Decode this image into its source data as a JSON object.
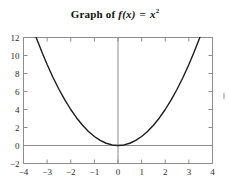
{
  "title": {
    "prefix": "Graph of ",
    "function_name": "f",
    "argument": "(x)",
    "equals": " = ",
    "expression_base": "x",
    "expression_exponent": "2",
    "plain": "Graph of f(x) = x^2"
  },
  "chart_data": {
    "type": "line",
    "xlabel": "",
    "ylabel": "",
    "function": "f(x) = x^2",
    "xlim": [
      -4,
      4
    ],
    "ylim": [
      -2,
      12
    ],
    "grid": false,
    "legend": null,
    "x_ticks": [
      -4,
      -3,
      -2,
      -1,
      0,
      1,
      2,
      3,
      4
    ],
    "x_tick_labels": [
      "-4",
      "-3",
      "-2",
      "-1",
      "0",
      "1",
      "2",
      "3",
      "4"
    ],
    "y_ticks": [
      -2,
      0,
      2,
      4,
      6,
      8,
      10,
      12
    ],
    "y_tick_labels": [
      "-2",
      "0",
      "2",
      "4",
      "6",
      "8",
      "10",
      "12"
    ],
    "series": [
      {
        "name": "f(x) = x^2",
        "color": "#1c1c1c",
        "x": [
          -3.464,
          -3.2,
          -3.0,
          -2.75,
          -2.5,
          -2.25,
          -2.0,
          -1.75,
          -1.5,
          -1.25,
          -1.0,
          -0.75,
          -0.5,
          -0.25,
          0,
          0.25,
          0.5,
          0.75,
          1.0,
          1.25,
          1.5,
          1.75,
          2.0,
          2.25,
          2.5,
          2.75,
          3.0,
          3.2,
          3.464
        ],
        "y": [
          12.0,
          10.24,
          9.0,
          7.5625,
          6.25,
          5.0625,
          4.0,
          3.0625,
          2.25,
          1.5625,
          1.0,
          0.5625,
          0.25,
          0.0625,
          0,
          0.0625,
          0.25,
          0.5625,
          1.0,
          1.5625,
          2.25,
          3.0625,
          4.0,
          5.0625,
          6.25,
          7.5625,
          9.0,
          10.24,
          12.0
        ]
      }
    ],
    "vertex": {
      "x": 0,
      "y": 0
    },
    "axis_lines": {
      "x_axis_at_y": 0,
      "y_axis_at_x": 0
    },
    "colors": {
      "curve": "#1c1c1c",
      "frame": "#8c8c8c",
      "axis": "#8c8c8c",
      "text": "#2b2b2b",
      "background": "#ffffff"
    }
  }
}
